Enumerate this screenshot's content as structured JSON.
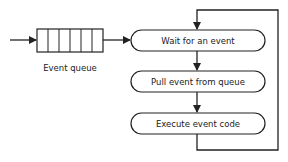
{
  "diagram": {
    "type": "event-loop flowchart",
    "queue": {
      "label": "Event queue",
      "slots": 6
    },
    "steps": [
      {
        "label": "Wait for an event"
      },
      {
        "label": "Pull event from queue"
      },
      {
        "label": "Execute event code"
      }
    ],
    "colors": {
      "stroke": "#222222",
      "background": "#ffffff",
      "text": "#222222"
    }
  }
}
